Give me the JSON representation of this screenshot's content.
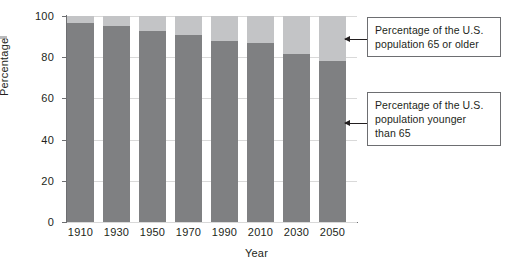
{
  "chart_data": {
    "type": "bar",
    "subtype": "stacked-bar-100",
    "title": "",
    "xlabel": "Year",
    "ylabel": "Percentage",
    "ylim": [
      0,
      100
    ],
    "yticks": [
      0,
      20,
      40,
      60,
      80,
      100
    ],
    "grid": true,
    "legend_position": "callout-annotations",
    "categories": [
      "1910",
      "1930",
      "1950",
      "1970",
      "1990",
      "2010",
      "2030",
      "2050"
    ],
    "series": [
      {
        "name": "Percentage of the U.S. population younger than 65",
        "color": "#7f8082",
        "values": [
          96.5,
          95,
          92.5,
          91,
          88,
          87,
          81.5,
          78
        ]
      },
      {
        "name": "Percentage of the U.S. population 65 or older",
        "color": "#c3c4c6",
        "values": [
          3.5,
          5,
          7.5,
          9,
          12,
          13,
          18.5,
          22
        ]
      }
    ],
    "annotations": [
      {
        "id": "old",
        "text": "Percentage of the U.S. population 65 or older",
        "points_to": "light-gray-top-segment"
      },
      {
        "id": "young",
        "text": "Percentage of the U.S. population younger than 65",
        "points_to": "dark-gray-bottom-segment"
      }
    ]
  },
  "axes": {
    "y_title": "Percentage",
    "x_title": "Year",
    "y_tick_labels": [
      "0",
      "20",
      "40",
      "60",
      "80",
      "100"
    ],
    "x_tick_labels": [
      "1910",
      "1930",
      "1950",
      "1970",
      "1990",
      "2010",
      "2030",
      "2050"
    ]
  },
  "callouts": {
    "old": {
      "line1": "Percentage of the U.S.",
      "line2": "population 65 or older",
      "full": "Percentage of the U.S. population 65 or older"
    },
    "young": {
      "line1": "Percentage of the U.S.",
      "line2": "population younger",
      "line3": "than 65",
      "full": "Percentage of the U.S. population younger than 65"
    }
  },
  "colors": {
    "younger_than_65": "#7f8082",
    "age_65_or_older": "#c3c4c6",
    "axis": "#6d6e71",
    "grid": "#d9d9d9",
    "text": "#231f20",
    "background": "#ffffff"
  }
}
